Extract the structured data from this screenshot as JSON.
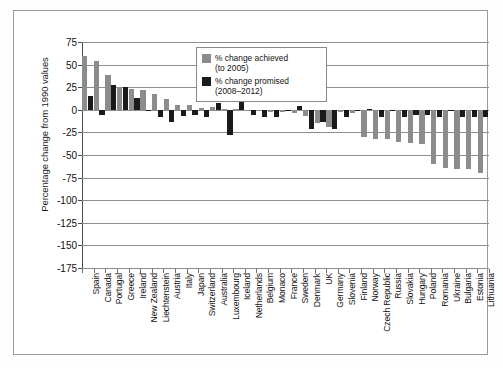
{
  "figure": {
    "background_color": "#ffffff",
    "border_color": "#9a9a9a"
  },
  "legend": {
    "position": "top-center",
    "entries": [
      {
        "label": "% change achieved",
        "sublabel": "(to 2005)",
        "color": "#8c8c8c",
        "swatch": "gray-square-icon"
      },
      {
        "label": "% change promised",
        "sublabel": "(2008–2012)",
        "color": "#1a1a1a",
        "swatch": "black-square-icon"
      }
    ]
  },
  "chart_data": {
    "type": "bar",
    "title": "",
    "subtitle": "",
    "xlabel": "",
    "ylabel": "Percentage change from 1990 values",
    "ylim": [
      -175,
      75
    ],
    "yticks": [
      75,
      50,
      25,
      0,
      -25,
      -50,
      -75,
      -100,
      -125,
      -150,
      -175
    ],
    "grid": true,
    "legend_position": "top-center",
    "categories": [
      "Spain",
      "Canada",
      "Portugal",
      "Greece",
      "Ireland",
      "New Zealand",
      "Liechtenstein",
      "Austria",
      "Italy",
      "Japan",
      "Switzerland",
      "Australia",
      "Luxembourg",
      "Iceland",
      "Netherlands",
      "Belgium",
      "Monaco",
      "France",
      "Sweden",
      "Denmark",
      "UK",
      "Germany",
      "Slovenia",
      "Finland",
      "Norway",
      "Czech Republic",
      "Russia",
      "Slovakia",
      "Hungary",
      "Poland",
      "Romania",
      "Ukraine",
      "Bulgaria",
      "Estonia",
      "Lithuania"
    ],
    "series": [
      {
        "name": "% change achieved (to 2005)",
        "color": "#8c8c8c",
        "values": [
          59,
          54,
          39,
          24,
          23,
          22,
          17,
          12,
          5,
          5,
          2,
          3,
          1,
          1,
          -1,
          -1,
          -2,
          -2,
          -3,
          -7,
          -15,
          -19,
          -2,
          -3,
          -30,
          -32,
          -32,
          -36,
          -37,
          -38,
          -60,
          -64,
          -65,
          -66,
          -70
        ]
      },
      {
        "name": "% change promised (2008–2012)",
        "color": "#1a1a1a",
        "values": [
          15,
          -6,
          27,
          25,
          13,
          0,
          -8,
          -13,
          -7,
          -6,
          -8,
          8,
          -28,
          10,
          -6,
          -8,
          -8,
          0,
          4,
          -21,
          -13,
          -21,
          -8,
          0,
          1,
          -8,
          0,
          -8,
          -6,
          -6,
          -8,
          0,
          -8,
          -8,
          -8
        ]
      }
    ]
  }
}
